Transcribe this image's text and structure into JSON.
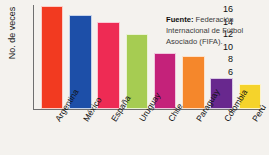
{
  "chart_data": {
    "type": "bar",
    "title": "",
    "xlabel": "",
    "ylabel": "No. de veces",
    "ylim": [
      0,
      16
    ],
    "ytick_step": 2,
    "yticks": [
      16,
      14,
      12,
      10,
      8,
      6,
      4,
      2,
      0
    ],
    "grid": false,
    "legend": "none",
    "categories": [
      "Argentina",
      "México",
      "España",
      "Uruguay",
      "Chile",
      "Paraguay",
      "Colombia",
      "Perú"
    ],
    "values": [
      16.5,
      15,
      14,
      12,
      9,
      8.5,
      5,
      4
    ],
    "colors": [
      "#F23A20",
      "#1D4FA8",
      "#EE2B54",
      "#A6CC52",
      "#C4227A",
      "#F5872B",
      "#68288E",
      "#F5D32B"
    ],
    "annotations": [
      {
        "name": "source",
        "label": "Fuente:",
        "text": "Federación Internacional de Fútbol Asociado (FIFA)."
      }
    ]
  },
  "axis": {
    "y_title": "No. de veces"
  },
  "source": {
    "label": "Fuente:",
    "text": "Federación Internacional de Fútbol Asociado (FIFA)."
  }
}
